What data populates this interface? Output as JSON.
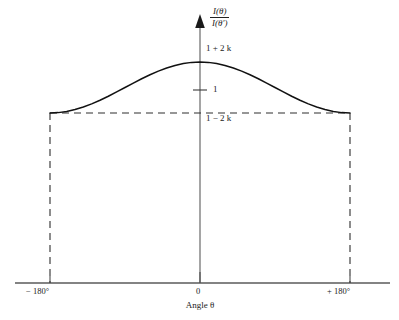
{
  "chart_data": {
    "type": "line",
    "title": "",
    "subtitle": "",
    "xlabel": "Angle θ",
    "ylabel": "I(θ) / I(θ′)",
    "ylabel_numerator": "I(θ)",
    "ylabel_denominator": "I(θ′)",
    "xlim": [
      -180,
      180
    ],
    "x_tick_labels": [
      "− 180°",
      "0",
      "+ 180°"
    ],
    "x_ticks": [
      -180,
      0,
      180
    ],
    "y_tick_labels": [
      "1 + 2 k",
      "1",
      "1 − 2 k"
    ],
    "y_tick_values": [
      1.2,
      1.0,
      0.8
    ],
    "ylim": [
      0,
      1.32
    ],
    "grid": false,
    "legend": null,
    "annotations": [
      "dashed rectangle from −180° to +180° at level 1 − 2 k down to the axis"
    ],
    "series": [
      {
        "name": "I(θ)/I(θ′) = 1 + 2k cosθ",
        "style": "solid",
        "x": [
          -180,
          -170,
          -160,
          -150,
          -140,
          -130,
          -120,
          -110,
          -100,
          -90,
          -80,
          -70,
          -60,
          -50,
          -40,
          -30,
          -20,
          -10,
          0,
          10,
          20,
          30,
          40,
          50,
          60,
          70,
          80,
          90,
          100,
          110,
          120,
          130,
          140,
          150,
          160,
          170,
          180
        ],
        "y": [
          0.8,
          0.803,
          0.8121,
          0.8268,
          0.8468,
          0.8714,
          0.9,
          0.9316,
          0.9653,
          1.0,
          1.0347,
          1.0684,
          1.1,
          1.1286,
          1.1532,
          1.1732,
          1.1879,
          1.197,
          1.2,
          1.197,
          1.1879,
          1.1732,
          1.1532,
          1.1286,
          1.1,
          1.0684,
          1.0347,
          1.0,
          0.9653,
          0.9316,
          0.9,
          0.8714,
          0.8468,
          0.8268,
          0.8121,
          0.803,
          0.8
        ]
      }
    ],
    "reference_lines": [
      {
        "name": "baseline-dashed",
        "orientation": "horizontal",
        "value": 0.8,
        "style": "dashed",
        "from_x": -180,
        "to_x": 180
      },
      {
        "name": "left-boundary-dashed",
        "orientation": "vertical",
        "value": -180,
        "style": "dashed",
        "from_y": 0,
        "to_y": 0.8
      },
      {
        "name": "right-boundary-dashed",
        "orientation": "vertical",
        "value": 180,
        "style": "dashed",
        "from_y": 0,
        "to_y": 0.8
      }
    ],
    "colors": {
      "curve": "#111111",
      "axis": "#4d4d4d",
      "dashed": "#333333",
      "background": "#ffffff",
      "text": "#222222"
    }
  }
}
